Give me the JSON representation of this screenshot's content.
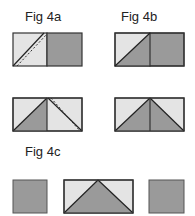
{
  "figures": {
    "fig4a": {
      "label": "Fig 4a"
    },
    "fig4b": {
      "label": "Fig 4b"
    },
    "fig4c": {
      "label": "Fig 4c"
    }
  },
  "colors": {
    "light": "#e4e4e4",
    "dark": "#9a9a9a",
    "stroke": "#333333"
  }
}
